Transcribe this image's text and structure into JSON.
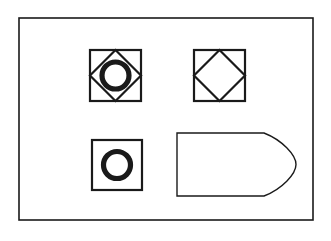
{
  "figure": {
    "background_color": "#ffffff",
    "stroke_color": "#1a1a1a",
    "fill_color": "none",
    "canvas": {
      "width": 331,
      "height": 241
    },
    "outer_frame": {
      "name": "outer-rectangle-border",
      "x": 19,
      "y": 18,
      "width": 294,
      "height": 202,
      "stroke_width": 1.6
    },
    "shapes": [
      {
        "id": "shape-1",
        "name": "square-with-diamond-and-circle",
        "label": "Square containing inscribed diamond and bold circle",
        "square": {
          "x": 90,
          "y": 50,
          "width": 51,
          "height": 51,
          "stroke_width": 2.2
        },
        "diamond": {
          "cx": 115.5,
          "cy": 75.5,
          "rx": 25.5,
          "ry": 25.5,
          "stroke_width": 2.2
        },
        "circle": {
          "cx": 115.5,
          "cy": 75.5,
          "r": 13.5,
          "stroke_width": 5.2
        }
      },
      {
        "id": "shape-2",
        "name": "square-with-diamond",
        "label": "Square containing inscribed diamond",
        "square": {
          "x": 194,
          "y": 50,
          "width": 51,
          "height": 51,
          "stroke_width": 2.2
        },
        "diamond": {
          "cx": 219.5,
          "cy": 75.5,
          "rx": 25.5,
          "ry": 25.5,
          "stroke_width": 2.2
        }
      },
      {
        "id": "shape-3",
        "name": "square-with-circle",
        "label": "Square containing bold circle",
        "square": {
          "x": 92,
          "y": 140,
          "width": 50,
          "height": 50,
          "stroke_width": 2.2
        },
        "circle": {
          "cx": 117,
          "cy": 165,
          "r": 13.5,
          "stroke_width": 5.2
        }
      },
      {
        "id": "shape-4",
        "name": "pentagon-arrow-shape",
        "label": "Home-plate pentagon with rounded right point",
        "path": "M 177 133 L 264 133 C 282 140 296 155 296 164.5 C 296 174 282 189 264 196 L 177 196 Z",
        "stroke_width": 1.4
      }
    ]
  }
}
